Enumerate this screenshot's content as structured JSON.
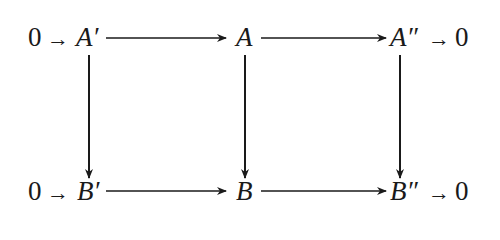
{
  "diagram": {
    "type": "commutative-diagram",
    "rows": [
      {
        "left_zero": "0",
        "left_arrow": "→",
        "nodes": [
          "A′",
          "A",
          "A″"
        ],
        "right_arrow": "→",
        "right_zero": "0"
      },
      {
        "left_zero": "0",
        "left_arrow": "→",
        "nodes": [
          "B′",
          "B",
          "B″"
        ],
        "right_arrow": "→",
        "right_zero": "0"
      }
    ],
    "edges": [
      {
        "from": "A′",
        "to": "A",
        "direction": "horizontal"
      },
      {
        "from": "A",
        "to": "A″",
        "direction": "horizontal"
      },
      {
        "from": "B′",
        "to": "B",
        "direction": "horizontal"
      },
      {
        "from": "B",
        "to": "B″",
        "direction": "horizontal"
      },
      {
        "from": "A′",
        "to": "B′",
        "direction": "vertical"
      },
      {
        "from": "A",
        "to": "B",
        "direction": "vertical"
      },
      {
        "from": "A″",
        "to": "B″",
        "direction": "vertical"
      }
    ],
    "colors": {
      "ink": "#1a1a1a",
      "background": "#ffffff"
    }
  }
}
